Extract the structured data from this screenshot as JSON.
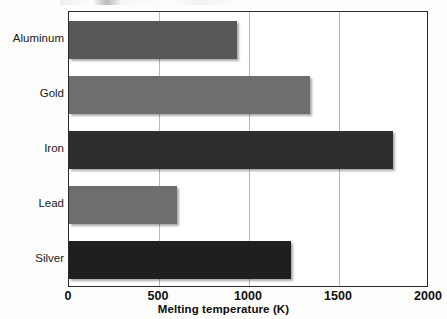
{
  "chart_data": {
    "type": "bar",
    "orientation": "horizontal",
    "title": "",
    "xlabel": "Melting temperature (K)",
    "ylabel": "",
    "categories": [
      "Aluminum",
      "Gold",
      "Iron",
      "Lead",
      "Silver"
    ],
    "values": [
      933,
      1337,
      1800,
      600,
      1235
    ],
    "xlim": [
      0,
      2000
    ],
    "xticks": [
      0,
      500,
      1000,
      1500,
      2000
    ],
    "xtick_labels": [
      "0",
      "500",
      "1000",
      "1500",
      "2000"
    ],
    "grid": "vertical-only",
    "legend": "none",
    "bar_colors": [
      "#58585a",
      "#6e6e70",
      "#2e2e30",
      "#6e6e70",
      "#1f1f22"
    ],
    "series": [
      {
        "name": "Melting temperature (K)",
        "points": [
          {
            "category": "Aluminum",
            "value": 933,
            "color": "#58585a"
          },
          {
            "category": "Gold",
            "value": 1337,
            "color": "#6e6e70"
          },
          {
            "category": "Iron",
            "value": 1800,
            "color": "#2e2e30"
          },
          {
            "category": "Lead",
            "value": 600,
            "color": "#6e6e70"
          },
          {
            "category": "Silver",
            "value": 1235,
            "color": "#1f1f22"
          }
        ]
      }
    ]
  },
  "axis": {
    "frame_color": "#2b2b2b",
    "gridline_color": "#b9b9b9"
  }
}
